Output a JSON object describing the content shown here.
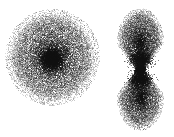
{
  "figure": {
    "title": "",
    "background_color": "#ffffff",
    "particle_color": "#101010",
    "width": 174,
    "height": 137,
    "type": "particle-scatter-rendering",
    "objects": [
      {
        "name": "spheroidal-cloud",
        "label": "",
        "shape": "spheroid",
        "center_x": 52,
        "center_y": 57,
        "radius_x": 40,
        "radius_y": 41,
        "core_x": 51,
        "core_y": 59,
        "core_radius": 7,
        "particle_count": 16000,
        "core_particle_count": 2600,
        "halo_particle_count": 3400,
        "point_size": 1,
        "base_opacity": 0.5
      },
      {
        "name": "bipolar-cloud",
        "label": "",
        "shape": "bilobed-bipolar",
        "center_x": 140,
        "center_y": 69,
        "waist_x": 140,
        "waist_y": 69,
        "waist_knot_radius": 2.6,
        "lobes": [
          {
            "name": "upper-lobe",
            "center_x": 140,
            "center_y": 42,
            "radius_x": 20,
            "radius_y": 29,
            "core_x": 140,
            "core_y": 59,
            "core_radius": 6,
            "particle_count": 8200,
            "core_particle_count": 1500
          },
          {
            "name": "lower-lobe",
            "center_x": 140,
            "center_y": 96,
            "radius_x": 20,
            "radius_y": 29,
            "core_x": 140,
            "core_y": 79,
            "core_radius": 6,
            "particle_count": 8200,
            "core_particle_count": 1500
          }
        ],
        "point_size": 1,
        "base_opacity": 0.5
      }
    ]
  },
  "chart_data": {
    "type": "scatter",
    "title": "",
    "xlabel": "",
    "ylabel": "",
    "grid": false,
    "legend": false,
    "xlim": [
      0,
      174
    ],
    "ylim": [
      0,
      137
    ],
    "series": [
      {
        "name": "spheroidal-cloud",
        "description": "Dense centrally-concentrated roughly circular particle cloud with a compact dark nucleus",
        "center": [
          52,
          57
        ],
        "extent": [
          40,
          41
        ],
        "peak_density_point": [
          51,
          59
        ],
        "n_points": 16000
      },
      {
        "name": "bipolar-upper-lobe",
        "description": "Upper lobe of bipolar particle cloud, density peaks toward the waist",
        "center": [
          140,
          42
        ],
        "extent": [
          20,
          29
        ],
        "peak_density_point": [
          140,
          59
        ],
        "n_points": 8200
      },
      {
        "name": "bipolar-lower-lobe",
        "description": "Lower lobe of bipolar particle cloud, density peaks toward the waist",
        "center": [
          140,
          96
        ],
        "extent": [
          20,
          29
        ],
        "peak_density_point": [
          140,
          79
        ],
        "n_points": 8200
      },
      {
        "name": "waist-knot",
        "description": "Small very dark compact knot pinched between the two lobes",
        "center": [
          140,
          69
        ],
        "extent": [
          2.6,
          2.6
        ],
        "peak_density_point": [
          140,
          69
        ],
        "n_points": 900
      }
    ]
  }
}
